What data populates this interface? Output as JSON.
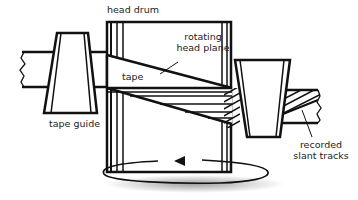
{
  "diagram": {
    "labels": {
      "head_drum": "head drum",
      "rotating_head_plane_1": "rotating",
      "rotating_head_plane_2": "head plane",
      "tape": "tape",
      "tape_guide": "tape guide",
      "recorded_slant_tracks_1": "recorded",
      "recorded_slant_tracks_2": "slant tracks"
    },
    "components": [
      "tape",
      "tape guide (left)",
      "head drum",
      "tape guide (right)",
      "recorded slant tracks",
      "rotation arrow"
    ],
    "colors": {
      "line": "#111111",
      "background": "#ffffff",
      "shadow": "#888888"
    }
  }
}
